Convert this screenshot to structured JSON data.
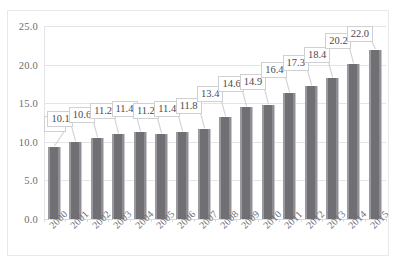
{
  "chart_data": {
    "type": "bar",
    "title": "",
    "xlabel": "",
    "ylabel": "",
    "ylim": [
      0.0,
      25.0
    ],
    "ytick_labels": [
      "25.0",
      "20.0",
      "15.0",
      "10.0",
      "5.0",
      "0.0"
    ],
    "ytick_values": [
      25.0,
      20.0,
      15.0,
      10.0,
      5.0,
      0.0
    ],
    "grid": true,
    "legend": "none",
    "bar_color": "#6f6f74",
    "categories": [
      "2000",
      "2001",
      "2002",
      "2003",
      "2004",
      "2005",
      "2006",
      "2007",
      "2008",
      "2009",
      "2010",
      "2011",
      "2012",
      "2013",
      "2014",
      "2015"
    ],
    "values": [
      9.4,
      10.1,
      10.6,
      11.2,
      11.4,
      11.2,
      11.4,
      11.8,
      13.4,
      14.6,
      14.9,
      16.4,
      17.3,
      18.4,
      20.2,
      22.0
    ],
    "data_labels": [
      "9.4",
      "10.1",
      "10.6",
      "11.2",
      "11.4",
      "11.2",
      "11.4",
      "11.8",
      "13.4",
      "14.6",
      "14.9",
      "16.4",
      "17.3",
      "18.4",
      "20.2",
      "22.0"
    ]
  }
}
